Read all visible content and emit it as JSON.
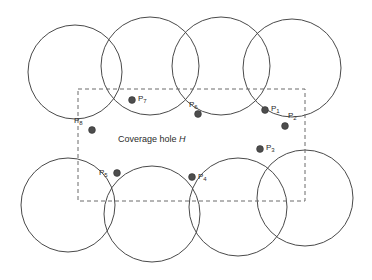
{
  "figure": {
    "caption_prefix": "Coverage hole",
    "caption_symbol": "H",
    "caption_x": 118,
    "caption_y": 135,
    "background_color": "#ffffff",
    "circle_stroke_color": "#4a4a4a",
    "dot_fill_color": "#4d4d4d",
    "dash_stroke_color": "#6b6b6b"
  },
  "hole_rect": {
    "label": "coverage-hole-boundary",
    "x": 78,
    "y": 89,
    "width": 227,
    "height": 112
  },
  "circles": [
    {
      "name": "circle-top-1",
      "cx": 75,
      "cy": 72,
      "r": 47
    },
    {
      "name": "circle-top-2",
      "cx": 150,
      "cy": 66,
      "r": 49
    },
    {
      "name": "circle-top-3",
      "cx": 221,
      "cy": 66,
      "r": 49
    },
    {
      "name": "circle-top-4",
      "cx": 292,
      "cy": 68,
      "r": 49
    },
    {
      "name": "circle-bottom-1",
      "cx": 68,
      "cy": 205,
      "r": 47
    },
    {
      "name": "circle-bottom-2",
      "cx": 152,
      "cy": 214,
      "r": 48
    },
    {
      "name": "circle-bottom-3",
      "cx": 238,
      "cy": 207,
      "r": 49
    },
    {
      "name": "circle-bottom-4",
      "cx": 305,
      "cy": 198,
      "r": 48
    }
  ],
  "vertices": [
    {
      "name": "vertex-p1",
      "label": "P",
      "sub": "1",
      "cx": 265,
      "cy": 110,
      "lx": 271,
      "ly": 105
    },
    {
      "name": "vertex-p2",
      "label": "P",
      "sub": "2",
      "cx": 285,
      "cy": 126,
      "lx": 288,
      "ly": 112
    },
    {
      "name": "vertex-p3",
      "label": "P",
      "sub": "3",
      "cx": 260,
      "cy": 149,
      "lx": 266,
      "ly": 144
    },
    {
      "name": "vertex-p4",
      "label": "P",
      "sub": "4",
      "cx": 192,
      "cy": 177,
      "lx": 198,
      "ly": 173
    },
    {
      "name": "vertex-p5",
      "label": "P",
      "sub": "5",
      "cx": 117,
      "cy": 173,
      "lx": 99,
      "ly": 169
    },
    {
      "name": "vertex-p6",
      "label": "P",
      "sub": "6",
      "cx": 198,
      "cy": 114,
      "lx": 189,
      "ly": 101
    },
    {
      "name": "vertex-p7",
      "label": "P",
      "sub": "7",
      "cx": 132,
      "cy": 100,
      "lx": 138,
      "ly": 95
    },
    {
      "name": "vertex-p8",
      "label": "P",
      "sub": "8",
      "cx": 92,
      "cy": 130,
      "lx": 74,
      "ly": 117
    }
  ]
}
